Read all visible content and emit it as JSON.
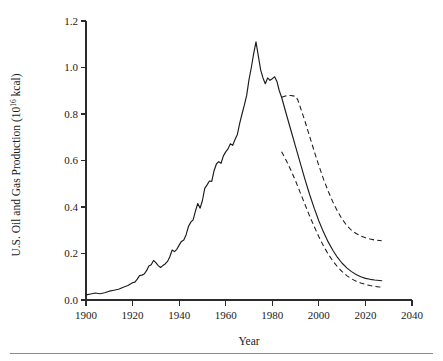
{
  "figure": {
    "background_color": "#ffffff",
    "line_color": "#1c1c1c",
    "axis_color": "#2b2b2b",
    "footer_rule_color": "#8c8c8c"
  },
  "axes": {
    "y_title_main": "U.S. Oil and Gas Production (10",
    "y_title_exponent": "16",
    "y_title_tail": " kcal)",
    "x_title": "Year"
  },
  "chart_data": {
    "type": "line",
    "title": "",
    "subtitle": "",
    "xlabel": "Year",
    "ylabel": "U.S. Oil and Gas Production (10^16 kcal)",
    "xlim": [
      1900,
      2040
    ],
    "ylim": [
      0.0,
      1.2
    ],
    "xticks": [
      1900,
      1920,
      1940,
      1960,
      1980,
      2000,
      2020,
      2040
    ],
    "xtick_labels": [
      "1900",
      "1920",
      "1940",
      "1960",
      "1980",
      "2000",
      "2020",
      "2040"
    ],
    "yticks": [
      0.0,
      0.2,
      0.4,
      0.6,
      0.8,
      1.0,
      1.2
    ],
    "ytick_labels": [
      "0.0",
      "0.2",
      "0.4",
      "0.6",
      "0.8",
      "1.0",
      "1.2"
    ],
    "grid": false,
    "legend": null,
    "legend_position": "none",
    "annotations": [],
    "series": [
      {
        "name": "Historical production and mid projection",
        "style": "solid",
        "color": "#1c1c1c",
        "points": [
          [
            1900,
            0.022
          ],
          [
            1902,
            0.026
          ],
          [
            1904,
            0.03
          ],
          [
            1906,
            0.027
          ],
          [
            1908,
            0.031
          ],
          [
            1910,
            0.038
          ],
          [
            1912,
            0.042
          ],
          [
            1914,
            0.046
          ],
          [
            1916,
            0.055
          ],
          [
            1918,
            0.062
          ],
          [
            1920,
            0.074
          ],
          [
            1921,
            0.077
          ],
          [
            1922,
            0.09
          ],
          [
            1923,
            0.105
          ],
          [
            1924,
            0.107
          ],
          [
            1925,
            0.112
          ],
          [
            1926,
            0.126
          ],
          [
            1927,
            0.146
          ],
          [
            1928,
            0.152
          ],
          [
            1929,
            0.17
          ],
          [
            1930,
            0.161
          ],
          [
            1931,
            0.148
          ],
          [
            1932,
            0.14
          ],
          [
            1933,
            0.148
          ],
          [
            1934,
            0.155
          ],
          [
            1935,
            0.166
          ],
          [
            1936,
            0.186
          ],
          [
            1937,
            0.215
          ],
          [
            1938,
            0.208
          ],
          [
            1939,
            0.218
          ],
          [
            1940,
            0.236
          ],
          [
            1941,
            0.252
          ],
          [
            1942,
            0.258
          ],
          [
            1943,
            0.281
          ],
          [
            1944,
            0.316
          ],
          [
            1945,
            0.335
          ],
          [
            1946,
            0.345
          ],
          [
            1947,
            0.382
          ],
          [
            1948,
            0.415
          ],
          [
            1949,
            0.395
          ],
          [
            1950,
            0.428
          ],
          [
            1951,
            0.48
          ],
          [
            1952,
            0.495
          ],
          [
            1953,
            0.512
          ],
          [
            1954,
            0.51
          ],
          [
            1955,
            0.556
          ],
          [
            1956,
            0.585
          ],
          [
            1957,
            0.595
          ],
          [
            1958,
            0.588
          ],
          [
            1959,
            0.62
          ],
          [
            1960,
            0.637
          ],
          [
            1961,
            0.65
          ],
          [
            1962,
            0.672
          ],
          [
            1963,
            0.665
          ],
          [
            1964,
            0.69
          ],
          [
            1965,
            0.712
          ],
          [
            1966,
            0.76
          ],
          [
            1967,
            0.8
          ],
          [
            1968,
            0.838
          ],
          [
            1969,
            0.88
          ],
          [
            1970,
            0.948
          ],
          [
            1971,
            1.0
          ],
          [
            1972,
            1.06
          ],
          [
            1973,
            1.11
          ],
          [
            1974,
            1.05
          ],
          [
            1975,
            0.99
          ],
          [
            1976,
            0.955
          ],
          [
            1977,
            0.93
          ],
          [
            1978,
            0.955
          ],
          [
            1979,
            0.945
          ],
          [
            1980,
            0.952
          ],
          [
            1981,
            0.96
          ],
          [
            1982,
            0.94
          ],
          [
            1983,
            0.9
          ],
          [
            1984,
            0.872
          ],
          [
            1986,
            0.8
          ],
          [
            1988,
            0.73
          ],
          [
            1990,
            0.66
          ],
          [
            1992,
            0.59
          ],
          [
            1994,
            0.52
          ],
          [
            1996,
            0.455
          ],
          [
            1998,
            0.395
          ],
          [
            2000,
            0.34
          ],
          [
            2002,
            0.292
          ],
          [
            2004,
            0.25
          ],
          [
            2006,
            0.214
          ],
          [
            2008,
            0.183
          ],
          [
            2010,
            0.158
          ],
          [
            2012,
            0.138
          ],
          [
            2014,
            0.122
          ],
          [
            2016,
            0.11
          ],
          [
            2018,
            0.1
          ],
          [
            2020,
            0.093
          ],
          [
            2022,
            0.089
          ],
          [
            2024,
            0.086
          ],
          [
            2026,
            0.084
          ],
          [
            2027,
            0.083
          ]
        ]
      },
      {
        "name": "Upper projection bound",
        "style": "dashed",
        "color": "#1c1c1c",
        "points": [
          [
            1984,
            0.872
          ],
          [
            1986,
            0.878
          ],
          [
            1988,
            0.88
          ],
          [
            1990,
            0.876
          ],
          [
            1991,
            0.86
          ],
          [
            1992,
            0.83
          ],
          [
            1994,
            0.77
          ],
          [
            1996,
            0.705
          ],
          [
            1998,
            0.64
          ],
          [
            2000,
            0.578
          ],
          [
            2002,
            0.52
          ],
          [
            2004,
            0.468
          ],
          [
            2006,
            0.422
          ],
          [
            2008,
            0.382
          ],
          [
            2010,
            0.348
          ],
          [
            2012,
            0.32
          ],
          [
            2014,
            0.3
          ],
          [
            2016,
            0.286
          ],
          [
            2018,
            0.275
          ],
          [
            2020,
            0.268
          ],
          [
            2022,
            0.262
          ],
          [
            2024,
            0.258
          ],
          [
            2026,
            0.256
          ],
          [
            2027,
            0.255
          ]
        ]
      },
      {
        "name": "Lower projection bound",
        "style": "dashed",
        "color": "#1c1c1c",
        "points": [
          [
            1984,
            0.638
          ],
          [
            1986,
            0.6
          ],
          [
            1988,
            0.558
          ],
          [
            1990,
            0.512
          ],
          [
            1992,
            0.462
          ],
          [
            1994,
            0.412
          ],
          [
            1996,
            0.362
          ],
          [
            1998,
            0.316
          ],
          [
            2000,
            0.272
          ],
          [
            2002,
            0.232
          ],
          [
            2004,
            0.198
          ],
          [
            2006,
            0.168
          ],
          [
            2008,
            0.143
          ],
          [
            2010,
            0.122
          ],
          [
            2012,
            0.105
          ],
          [
            2014,
            0.091
          ],
          [
            2016,
            0.081
          ],
          [
            2018,
            0.073
          ],
          [
            2020,
            0.067
          ],
          [
            2022,
            0.062
          ],
          [
            2024,
            0.058
          ],
          [
            2026,
            0.056
          ],
          [
            2027,
            0.055
          ]
        ]
      }
    ]
  }
}
